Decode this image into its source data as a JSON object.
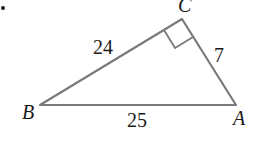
{
  "figure": {
    "bullet": "•",
    "vertices": {
      "A": "A",
      "B": "B",
      "C": "C"
    },
    "sides": {
      "BC": "24",
      "CA": "7",
      "BA": "25"
    },
    "right_angle_at": "C",
    "colors": {
      "stroke": "#7a7a7a",
      "text": "#1a1a1a"
    }
  }
}
